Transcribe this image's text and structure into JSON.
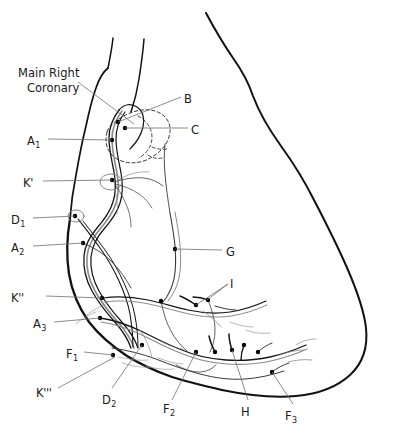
{
  "figure": {
    "kind": "anatomical-line-drawing",
    "background_color": "#ffffff",
    "outline_color": "#111111",
    "vessel_color": "#151515",
    "leader_color": "#6e6e6e",
    "width": 420,
    "height": 442
  },
  "title_annotation": {
    "line1": "Main Right",
    "line2": "Coronary",
    "x": 18,
    "y": 66
  },
  "labels": [
    {
      "id": "B",
      "text": "B",
      "sub": "",
      "x": 184,
      "y": 92,
      "align": "left"
    },
    {
      "id": "C",
      "text": "C",
      "sub": "",
      "x": 191,
      "y": 123,
      "align": "left"
    },
    {
      "id": "A1",
      "text": "A",
      "sub": "1",
      "x": 27,
      "y": 134,
      "align": "left"
    },
    {
      "id": "Kp",
      "text": "K'",
      "sub": "",
      "x": 23,
      "y": 176,
      "align": "left"
    },
    {
      "id": "D1",
      "text": "D",
      "sub": "1",
      "x": 11,
      "y": 213,
      "align": "left"
    },
    {
      "id": "A2",
      "text": "A",
      "sub": "2",
      "x": 11,
      "y": 241,
      "align": "left"
    },
    {
      "id": "G",
      "text": "G",
      "sub": "",
      "x": 226,
      "y": 245,
      "align": "left"
    },
    {
      "id": "I",
      "text": "I",
      "sub": "",
      "x": 230,
      "y": 277,
      "align": "left"
    },
    {
      "id": "Kpp",
      "text": "K''",
      "sub": "",
      "x": 11,
      "y": 291,
      "align": "left"
    },
    {
      "id": "A3",
      "text": "A",
      "sub": "3",
      "x": 33,
      "y": 317,
      "align": "left"
    },
    {
      "id": "F1",
      "text": "F",
      "sub": "1",
      "x": 66,
      "y": 347,
      "align": "left"
    },
    {
      "id": "Kppp",
      "text": "K'''",
      "sub": "",
      "x": 36,
      "y": 386,
      "align": "left"
    },
    {
      "id": "D2",
      "text": "D",
      "sub": "2",
      "x": 102,
      "y": 393,
      "align": "left"
    },
    {
      "id": "F2",
      "text": "F",
      "sub": "2",
      "x": 163,
      "y": 402,
      "align": "left"
    },
    {
      "id": "H",
      "text": "H",
      "sub": "",
      "x": 241,
      "y": 405,
      "align": "left"
    },
    {
      "id": "F3",
      "text": "F",
      "sub": "3",
      "x": 285,
      "y": 409,
      "align": "left"
    }
  ],
  "leader_lines": [
    {
      "for": "title_annotation",
      "from": [
        78,
        82
      ],
      "to": [
        134,
        124
      ]
    },
    {
      "for": "B",
      "from": [
        181,
        97
      ],
      "to": [
        118,
        122
      ]
    },
    {
      "for": "C",
      "from": [
        188,
        128
      ],
      "to": [
        125,
        128
      ]
    },
    {
      "for": "A1",
      "from": [
        48,
        139
      ],
      "to": [
        112,
        140
      ]
    },
    {
      "for": "Kp",
      "from": [
        43,
        181
      ],
      "to": [
        112,
        180
      ]
    },
    {
      "for": "D1",
      "from": [
        33,
        218
      ],
      "to": [
        75,
        216
      ]
    },
    {
      "for": "A2",
      "from": [
        33,
        246
      ],
      "to": [
        83,
        243
      ]
    },
    {
      "for": "G",
      "from": [
        222,
        250
      ],
      "to": [
        175,
        249
      ]
    },
    {
      "for": "I",
      "from": [
        228,
        284
      ],
      "to": [
        196,
        305
      ]
    },
    {
      "for": "I2",
      "from": [
        228,
        284
      ],
      "to": [
        207,
        300
      ]
    },
    {
      "for": "Kpp",
      "from": [
        46,
        296
      ],
      "to": [
        102,
        298
      ]
    },
    {
      "for": "A3",
      "from": [
        54,
        322
      ],
      "to": [
        100,
        318
      ]
    },
    {
      "for": "F1",
      "from": [
        84,
        352
      ],
      "to": [
        113,
        355
      ]
    },
    {
      "for": "Kppp",
      "from": [
        58,
        388
      ],
      "to": [
        115,
        357
      ]
    },
    {
      "for": "D2",
      "from": [
        112,
        388
      ],
      "to": [
        142,
        345
      ]
    },
    {
      "for": "F2",
      "from": [
        172,
        400
      ],
      "to": [
        196,
        352
      ]
    },
    {
      "for": "H",
      "from": [
        248,
        400
      ],
      "to": [
        232,
        350
      ]
    },
    {
      "for": "F3",
      "from": [
        293,
        404
      ],
      "to": [
        272,
        372
      ]
    }
  ],
  "marker_dots": [
    [
      112,
      140
    ],
    [
      125,
      128
    ],
    [
      118,
      122
    ],
    [
      112,
      180
    ],
    [
      75,
      216
    ],
    [
      83,
      243
    ],
    [
      175,
      249
    ],
    [
      102,
      298
    ],
    [
      100,
      318
    ],
    [
      113,
      355
    ],
    [
      142,
      345
    ],
    [
      161,
      301
    ],
    [
      196,
      305
    ],
    [
      208,
      300
    ],
    [
      215,
      352
    ],
    [
      232,
      350
    ],
    [
      244,
      345
    ],
    [
      258,
      352
    ],
    [
      272,
      372
    ],
    [
      196,
      352
    ]
  ],
  "structures": [
    {
      "name": "heart-silhouette",
      "description": "large rounded cardiac border, open at top"
    },
    {
      "name": "atrial-appendage",
      "description": "dashed ellipse near upper right coronary"
    },
    {
      "name": "right-coronary-trunk",
      "description": "main vertical descending trunk"
    },
    {
      "name": "marginal-branches",
      "description": "network of branching arterial twigs along inferior margin"
    }
  ]
}
